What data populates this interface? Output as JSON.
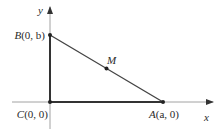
{
  "diagram": {
    "axes": {
      "x_label": "x",
      "y_label": "y"
    },
    "points": {
      "B": {
        "name": "B",
        "coords": "(0, b)"
      },
      "C": {
        "name": "C",
        "coords": "(0, 0)"
      },
      "A": {
        "name": "A",
        "coords": "(a, 0)"
      },
      "M": {
        "name": "M"
      }
    },
    "colors": {
      "axis": "#888888",
      "triangle": "#333333",
      "text": "#2a2a2a"
    }
  }
}
